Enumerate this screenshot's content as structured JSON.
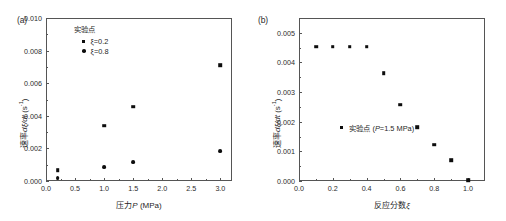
{
  "figure": {
    "background": "#ffffff",
    "marker_color": "#0d0d0d",
    "axis_color": "#555555"
  },
  "panels": [
    {
      "key": "a",
      "label": "(a)",
      "legend_title": "实验点",
      "legend_items": [
        {
          "marker": "square",
          "label": "ξ=0.2"
        },
        {
          "marker": "circle",
          "label": "ξ=0.8"
        }
      ],
      "xlabel_main": "压力",
      "xlabel_italic": "P",
      "xlabel_unit": " (MPa)",
      "ylabel_main": "速率",
      "ylabel_italic": "dξ/dt",
      "ylabel_unit": " (s",
      "ylabel_sup": "-1",
      "ylabel_close": ")",
      "xticks": [
        "0.0",
        "0.5",
        "1.0",
        "1.5",
        "2.0",
        "2.5",
        "3.0"
      ],
      "yticks": [
        "0.000",
        "0.002",
        "0.004",
        "0.006",
        "0.008",
        "0.010"
      ]
    },
    {
      "key": "b",
      "label": "(b)",
      "legend_inline_label": "实验点 (P=1.5 MPa)",
      "legend_inline_italic": "P",
      "legend_inline_prefix": "实验点 (",
      "legend_inline_suffix": "=1.5 MPa)",
      "xlabel_main": "反应分数",
      "xlabel_italic": "ξ",
      "ylabel_main": "速率",
      "ylabel_italic": "dξ/dt",
      "ylabel_unit": " (s",
      "ylabel_sup": "-1",
      "ylabel_close": ")",
      "xticks": [
        "0.0",
        "0.2",
        "0.4",
        "0.6",
        "0.8",
        "1.0"
      ],
      "yticks": [
        "0.000",
        "0.001",
        "0.002",
        "0.003",
        "0.004",
        "0.005"
      ]
    }
  ],
  "chart_data": [
    {
      "type": "scatter",
      "panel": "(a)",
      "title": "",
      "xlabel": "压力P (MPa)",
      "ylabel": "速率dξ/dt (s-1)",
      "xlim": [
        0.0,
        3.2
      ],
      "ylim": [
        0.0,
        0.01
      ],
      "xticks": [
        0.0,
        0.5,
        1.0,
        1.5,
        2.0,
        2.5,
        3.0
      ],
      "yticks": [
        0.0,
        0.002,
        0.004,
        0.006,
        0.008,
        0.01
      ],
      "grid": false,
      "legend_position": "top-left-inside",
      "series": [
        {
          "name": "ξ=0.2",
          "marker": "square",
          "x": [
            0.2,
            1.0,
            1.5,
            3.0
          ],
          "y": [
            0.00065,
            0.0034,
            0.00455,
            0.0071
          ]
        },
        {
          "name": "ξ=0.8",
          "marker": "circle",
          "x": [
            0.2,
            1.0,
            1.5,
            3.0
          ],
          "y": [
            0.00018,
            0.00087,
            0.00116,
            0.00182
          ]
        }
      ]
    },
    {
      "type": "scatter",
      "panel": "(b)",
      "title": "",
      "xlabel": "反应分数ξ",
      "ylabel": "速率dξ/dt (s-1)",
      "xlim": [
        0.0,
        1.1
      ],
      "ylim": [
        0.0,
        0.0055
      ],
      "xticks": [
        0.0,
        0.2,
        0.4,
        0.6,
        0.8,
        1.0
      ],
      "yticks": [
        0.0,
        0.001,
        0.002,
        0.003,
        0.004,
        0.005
      ],
      "grid": false,
      "legend_position": "center-left-inside",
      "series": [
        {
          "name": "实验点 (P=1.5 MPa)",
          "marker": "square",
          "x": [
            0.1,
            0.2,
            0.3,
            0.4,
            0.5,
            0.6,
            0.7,
            0.8,
            0.9,
            1.0
          ],
          "y": [
            0.00453,
            0.00453,
            0.00453,
            0.00453,
            0.00363,
            0.00258,
            0.00181,
            0.00122,
            0.00071,
            2e-05
          ]
        }
      ]
    }
  ]
}
